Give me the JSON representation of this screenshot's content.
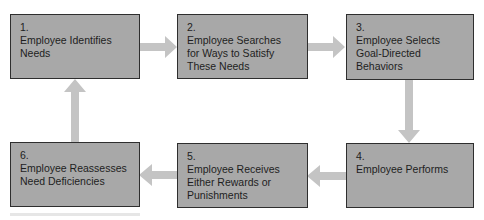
{
  "diagram": {
    "type": "cycle-flowchart",
    "colors": {
      "box_fill": "#a8a8a8",
      "box_border": "#2e2e2e",
      "arrow": "#c4c4c4",
      "text": "#1e1e1e",
      "background": "#ffffff"
    },
    "steps": [
      {
        "number": "1.",
        "text": "Employee Identifies\nNeeds"
      },
      {
        "number": "2.",
        "text": "Employee Searches\nfor Ways to Satisfy\nThese Needs"
      },
      {
        "number": "3.",
        "text": "Employee Selects\nGoal-Directed\nBehaviors"
      },
      {
        "number": "4.",
        "text": "Employee Performs"
      },
      {
        "number": "5.",
        "text": "Employee Receives\nEither Rewards or\nPunishments"
      },
      {
        "number": "6.",
        "text": "Employee Reassesses\nNeed Deficiencies"
      }
    ],
    "edges": [
      {
        "from": "1",
        "to": "2",
        "direction": "right"
      },
      {
        "from": "2",
        "to": "3",
        "direction": "right"
      },
      {
        "from": "3",
        "to": "4",
        "direction": "down"
      },
      {
        "from": "4",
        "to": "5",
        "direction": "left"
      },
      {
        "from": "5",
        "to": "6",
        "direction": "left"
      },
      {
        "from": "6",
        "to": "1",
        "direction": "up"
      }
    ]
  }
}
